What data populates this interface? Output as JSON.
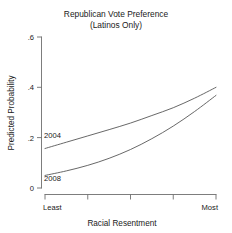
{
  "chart_data": {
    "type": "line",
    "title": "Republican Vote Preference",
    "subtitle": "(Latinos Only)",
    "xlabel": "Racial Resentment",
    "ylabel": "Predicted Probability",
    "xlim": [
      0,
      1
    ],
    "ylim": [
      0,
      0.6
    ],
    "grid": false,
    "legend_position": "inline-left",
    "y_ticks": [
      0,
      0.2,
      0.4,
      0.6
    ],
    "y_tick_labels": [
      "0",
      ".2",
      ".4",
      ".6"
    ],
    "x_tick_labels": [
      "Least",
      "",
      "",
      "",
      "Most"
    ],
    "x_tick_positions": [
      0,
      0.25,
      0.5,
      0.75,
      1
    ],
    "x_end_labels": {
      "left": "Least",
      "right": "Most"
    },
    "series": [
      {
        "name": "2004",
        "x": [
          0,
          0.125,
          0.25,
          0.375,
          0.5,
          0.625,
          0.75,
          0.875,
          1
        ],
        "values": [
          0.157,
          0.182,
          0.207,
          0.232,
          0.258,
          0.288,
          0.319,
          0.357,
          0.4
        ]
      },
      {
        "name": "2008",
        "x": [
          0,
          0.125,
          0.25,
          0.375,
          0.5,
          0.625,
          0.75,
          0.875,
          1
        ],
        "values": [
          0.05,
          0.068,
          0.09,
          0.118,
          0.153,
          0.196,
          0.246,
          0.304,
          0.368
        ]
      }
    ],
    "annotations": [
      {
        "text": "2004",
        "x": 0.02,
        "y": 0.205
      },
      {
        "text": "2008",
        "x": 0.02,
        "y": 0.04
      }
    ]
  },
  "colors": {
    "background": "#ffffff",
    "line": "#4d4d4d",
    "axis": "#6e6e6e",
    "text": "#1a1a1a"
  }
}
